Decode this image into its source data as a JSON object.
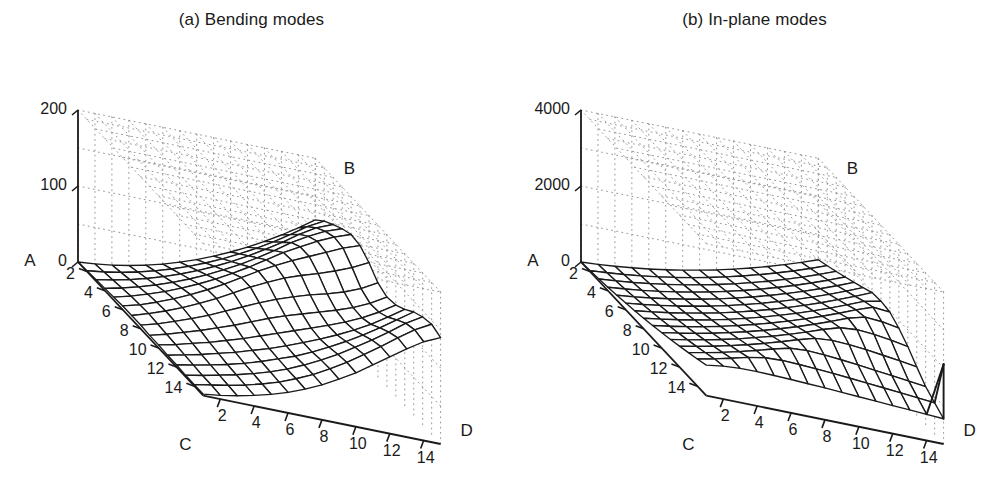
{
  "figure": {
    "background": "#ffffff",
    "ink": "#1a1a1a",
    "grid_color": "#9a9a9a"
  },
  "panels": [
    {
      "id": "a",
      "title": "(a) Bending modes",
      "axes": {
        "z": {
          "corner_label": "A",
          "ticks": [
            "0",
            "100",
            "200"
          ],
          "values": [
            0,
            100,
            200
          ],
          "min": 0,
          "max": 200
        },
        "back_corner_label": "B",
        "x": {
          "corner_label": "C",
          "ticks": [
            "2",
            "4",
            "6",
            "8",
            "10",
            "12",
            "14"
          ],
          "values": [
            2,
            4,
            6,
            8,
            10,
            12,
            14
          ],
          "min": 1,
          "max": 15
        },
        "y": {
          "corner_label": "D",
          "ticks": [
            "2",
            "4",
            "6",
            "8",
            "10",
            "12",
            "14"
          ],
          "values": [
            2,
            4,
            6,
            8,
            10,
            12,
            14
          ],
          "min": 1,
          "max": 15
        }
      }
    },
    {
      "id": "b",
      "title": "(b) In-plane modes",
      "axes": {
        "z": {
          "corner_label": "A",
          "ticks": [
            "0",
            "2000",
            "4000"
          ],
          "values": [
            0,
            2000,
            4000
          ],
          "min": 0,
          "max": 4000
        },
        "back_corner_label": "B",
        "x": {
          "corner_label": "C",
          "ticks": [
            "2",
            "4",
            "6",
            "8",
            "10",
            "12",
            "14"
          ],
          "values": [
            2,
            4,
            6,
            8,
            10,
            12,
            14
          ],
          "min": 1,
          "max": 15
        },
        "y": {
          "corner_label": "D",
          "ticks": [
            "2",
            "4",
            "6",
            "8",
            "10",
            "12",
            "14"
          ],
          "values": [
            2,
            4,
            6,
            8,
            10,
            12,
            14
          ],
          "min": 1,
          "max": 15
        }
      }
    }
  ],
  "chart_data": [
    {
      "type": "surface",
      "panel": "a",
      "title": "(a) Bending modes",
      "xlabel": "C",
      "ylabel": "D",
      "zlabel": "A",
      "legend": [],
      "grid": true,
      "xlim": [
        1,
        15
      ],
      "ylim": [
        1,
        15
      ],
      "zlim": [
        0,
        200
      ],
      "x": [
        1,
        2,
        3,
        4,
        5,
        6,
        7,
        8,
        9,
        10,
        11,
        12,
        13,
        14,
        15
      ],
      "y": [
        1,
        2,
        3,
        4,
        5,
        6,
        7,
        8,
        9,
        10,
        11,
        12,
        13,
        14,
        15
      ],
      "z": [
        [
          0,
          2,
          5,
          9,
          14,
          20,
          27,
          35,
          44,
          54,
          65,
          77,
          90,
          104,
          119
        ],
        [
          1,
          4,
          8,
          13,
          19,
          26,
          34,
          43,
          53,
          64,
          76,
          89,
          103,
          118,
          130
        ],
        [
          2,
          6,
          11,
          17,
          24,
          32,
          41,
          51,
          62,
          74,
          87,
          101,
          116,
          129,
          138
        ],
        [
          3,
          8,
          14,
          21,
          29,
          38,
          48,
          59,
          71,
          84,
          98,
          113,
          126,
          137,
          145
        ],
        [
          4,
          10,
          17,
          25,
          34,
          44,
          55,
          67,
          80,
          94,
          108,
          120,
          132,
          142,
          150
        ],
        [
          5,
          11,
          19,
          28,
          38,
          49,
          61,
          74,
          87,
          99,
          110,
          120,
          130,
          140,
          148
        ],
        [
          5,
          12,
          20,
          29,
          39,
          50,
          62,
          74,
          85,
          95,
          103,
          110,
          118,
          127,
          138
        ],
        [
          5,
          11,
          19,
          27,
          36,
          46,
          56,
          66,
          75,
          83,
          90,
          96,
          103,
          112,
          124
        ],
        [
          4,
          10,
          17,
          24,
          32,
          40,
          49,
          58,
          66,
          73,
          80,
          87,
          95,
          105,
          118
        ],
        [
          4,
          9,
          15,
          21,
          28,
          35,
          43,
          51,
          59,
          67,
          75,
          84,
          94,
          106,
          120
        ],
        [
          3,
          8,
          13,
          19,
          25,
          32,
          39,
          47,
          56,
          65,
          75,
          86,
          98,
          112,
          127
        ],
        [
          3,
          7,
          12,
          17,
          23,
          30,
          38,
          46,
          56,
          67,
          79,
          92,
          106,
          121,
          136
        ],
        [
          2,
          6,
          11,
          16,
          22,
          29,
          37,
          47,
          58,
          70,
          84,
          98,
          113,
          129,
          142
        ],
        [
          2,
          6,
          10,
          15,
          21,
          28,
          37,
          47,
          59,
          72,
          87,
          102,
          118,
          133,
          145
        ],
        [
          2,
          5,
          9,
          14,
          20,
          27,
          36,
          46,
          58,
          71,
          86,
          101,
          116,
          130,
          140
        ]
      ],
      "features": {
        "ridge_peak_value": 150,
        "ridge_location": "back-left edge near C=1..5, D=13..15",
        "saddle_dip_value": 80,
        "secondary_rise_value": 120,
        "front_corner_value": 0
      }
    },
    {
      "type": "surface",
      "panel": "b",
      "title": "(b) In-plane modes",
      "xlabel": "C",
      "ylabel": "D",
      "zlabel": "A",
      "legend": [],
      "grid": true,
      "xlim": [
        1,
        15
      ],
      "ylim": [
        1,
        15
      ],
      "zlim": [
        0,
        4000
      ],
      "x": [
        1,
        2,
        3,
        4,
        5,
        6,
        7,
        8,
        9,
        10,
        11,
        12,
        13,
        14,
        15
      ],
      "y": [
        1,
        2,
        3,
        4,
        5,
        6,
        7,
        8,
        9,
        10,
        11,
        12,
        13,
        14,
        15
      ],
      "z": [
        [
          0,
          30,
          70,
          120,
          180,
          250,
          330,
          420,
          520,
          630,
          750,
          880,
          1020,
          1170,
          1330
        ],
        [
          25,
          60,
          105,
          160,
          225,
          300,
          385,
          480,
          585,
          700,
          825,
          960,
          1105,
          1260,
          1425
        ],
        [
          55,
          95,
          145,
          205,
          275,
          355,
          445,
          545,
          655,
          775,
          905,
          1045,
          1195,
          1355,
          1525
        ],
        [
          90,
          135,
          190,
          255,
          330,
          415,
          510,
          615,
          730,
          855,
          990,
          1135,
          1290,
          1455,
          1630
        ],
        [
          130,
          180,
          240,
          310,
          390,
          480,
          580,
          690,
          810,
          940,
          1080,
          1230,
          1390,
          1560,
          1740
        ],
        [
          175,
          230,
          295,
          370,
          455,
          550,
          655,
          770,
          895,
          1030,
          1175,
          1330,
          1495,
          1670,
          1855
        ],
        [
          225,
          285,
          355,
          435,
          525,
          625,
          735,
          855,
          985,
          1125,
          1275,
          1435,
          1605,
          1785,
          1975
        ],
        [
          280,
          345,
          420,
          505,
          600,
          705,
          820,
          945,
          1080,
          1225,
          1380,
          1545,
          1720,
          1905,
          2000
        ],
        [
          340,
          410,
          490,
          580,
          680,
          790,
          910,
          1040,
          1180,
          1330,
          1490,
          1660,
          1840,
          2000,
          1960
        ],
        [
          405,
          480,
          565,
          660,
          765,
          880,
          1005,
          1140,
          1285,
          1440,
          1605,
          1780,
          1900,
          1870,
          1790
        ],
        [
          475,
          555,
          645,
          745,
          855,
          975,
          1105,
          1245,
          1395,
          1555,
          1690,
          1730,
          1700,
          1640,
          1560
        ],
        [
          550,
          635,
          730,
          835,
          950,
          1075,
          1210,
          1355,
          1480,
          1520,
          1500,
          1455,
          1400,
          1340,
          1275
        ],
        [
          630,
          720,
          820,
          930,
          1050,
          1180,
          1290,
          1320,
          1300,
          1260,
          1215,
          1165,
          1115,
          1060,
          1005
        ],
        [
          715,
          810,
          915,
          1030,
          1110,
          1130,
          1115,
          1090,
          1060,
          1025,
          990,
          950,
          910,
          870,
          830
        ],
        [
          805,
          870,
          900,
          905,
          895,
          880,
          860,
          840,
          815,
          790,
          765,
          740,
          715,
          690,
          665
        ]
      ],
      "features": {
        "peak_value": 2000,
        "peak_location": "back edge near D=10..12",
        "spike": {
          "present": true,
          "location": "right corner near C=14, D=14",
          "value": 2100,
          "description": "thin vertical spike at the far right corner"
        },
        "front_corner_value": 0
      }
    }
  ]
}
